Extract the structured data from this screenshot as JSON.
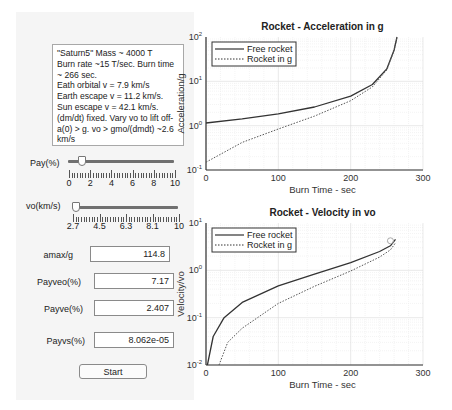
{
  "controls": {
    "info_text": "\"Saturn5\" Mass ~ 4000 T\nBurn rate ~15 T/sec.  Burn time ~ 266 sec.\nEath orbital v = 7.9 km/s\nEarth escape v = 11.2 km/s. Sun escape v = 42.1 km/s. (dm/dt) fixed. Vary vo to lift off- a(0) > g. vo > gmo/(dmdt) ~2.6 km/s",
    "pay_slider": {
      "label": "Pay(%)",
      "min": 0,
      "max": 10,
      "value": 1,
      "tick_labels": [
        "0",
        "2",
        "4",
        "6",
        "8",
        "10"
      ]
    },
    "vo_slider": {
      "label": "vo(km/s)",
      "min": 2.7,
      "max": 10,
      "value": 2.7,
      "tick_labels": [
        "2.7",
        "4.5",
        "6.3",
        "8.1",
        "10"
      ]
    },
    "fields": [
      {
        "label": "amax/g",
        "value": "114.8"
      },
      {
        "label": "Payveo(%)",
        "value": "7.17"
      },
      {
        "label": "Payve(%)",
        "value": "2.407"
      },
      {
        "label": "Payvs(%)",
        "value": "8.062e-05"
      }
    ],
    "start_label": "Start"
  },
  "chart_data": [
    {
      "type": "line",
      "title": "Rocket - Acceleration in g",
      "xlabel": "Burn Time - sec",
      "ylabel": "Acceleration/g",
      "yscale": "log",
      "xlim": [
        0,
        300
      ],
      "ylim": [
        0.1,
        100
      ],
      "xticks": [
        "0",
        "100",
        "200",
        "300"
      ],
      "yticks": [
        "10^-1",
        "10^0",
        "10^1",
        "10^2"
      ],
      "grid": true,
      "legend_position": "upper left",
      "legend": [
        "Free rocket",
        "Rocket in g"
      ],
      "series": [
        {
          "name": "Free rocket",
          "style": "solid",
          "x": [
            0,
            50,
            100,
            150,
            200,
            230,
            250,
            260,
            264
          ],
          "y": [
            1.15,
            1.42,
            1.84,
            2.64,
            4.65,
            8.5,
            19.1,
            51,
            100
          ]
        },
        {
          "name": "Rocket in g",
          "style": "dotted",
          "x": [
            0,
            50,
            100,
            150,
            200,
            230,
            250,
            260,
            264
          ],
          "y": [
            0.15,
            0.42,
            0.84,
            1.64,
            3.65,
            7.5,
            18.1,
            50,
            99
          ]
        }
      ]
    },
    {
      "type": "line",
      "title": "Rocket - Velocity in vo",
      "xlabel": "Burn Time - sec",
      "ylabel": "Velocity/vo",
      "yscale": "log",
      "xlim": [
        0,
        300
      ],
      "ylim": [
        0.01,
        10
      ],
      "xticks": [
        "0",
        "100",
        "200",
        "300"
      ],
      "yticks": [
        "10^-2",
        "10^-1",
        "10^0",
        "10^1"
      ],
      "grid": true,
      "legend_position": "upper left",
      "legend": [
        "Free rocket",
        "Rocket in g"
      ],
      "marker": {
        "x": 255,
        "y": 3.3,
        "shape": "circle"
      },
      "series": [
        {
          "name": "Free rocket",
          "style": "solid",
          "x": [
            2,
            10,
            25,
            50,
            100,
            150,
            200,
            240,
            255,
            262
          ],
          "y": [
            0.01,
            0.04,
            0.1,
            0.21,
            0.47,
            0.83,
            1.45,
            2.5,
            3.3,
            4.5
          ]
        },
        {
          "name": "Rocket in g",
          "style": "dotted",
          "x": [
            18,
            30,
            50,
            100,
            150,
            200,
            240,
            255,
            262
          ],
          "y": [
            0.01,
            0.03,
            0.06,
            0.2,
            0.46,
            0.97,
            1.9,
            2.7,
            3.8
          ]
        }
      ]
    }
  ]
}
